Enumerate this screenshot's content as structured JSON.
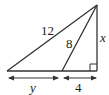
{
  "diagram": {
    "type": "right-triangle",
    "labels": {
      "hypotenuse": "12",
      "inner_segment": "8",
      "height": "x",
      "base_left": "y",
      "base_right": "4"
    },
    "right_angle_marker": true,
    "stroke_color": "#333333"
  }
}
